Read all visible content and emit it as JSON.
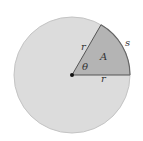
{
  "diagram": {
    "type": "circle-sector",
    "labels": {
      "radius_upper": "r",
      "radius_lower": "r",
      "arc": "s",
      "area": "A",
      "angle": "θ"
    },
    "colors": {
      "circle_fill": "#dcdcdc",
      "circle_stroke": "#c4c4c4",
      "sector_fill": "#b4b4b4",
      "sector_stroke": "#555555",
      "center_dot": "#111111"
    }
  }
}
